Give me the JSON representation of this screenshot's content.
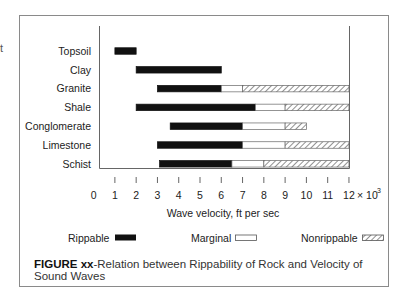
{
  "stray_text": "t",
  "caption": {
    "label": "FIGURE xx",
    "text": "-Relation between Rippability of Rock and Velocity of Sound Waves"
  },
  "legend": {
    "rippable": "Rippable",
    "marginal": "Marginal",
    "nonrippable": "Nonrippable"
  },
  "colors": {
    "rippable": "#111111",
    "marginal": "#ffffff",
    "nonrippable_hatch": "#555555",
    "frame": "#8a8a8a"
  },
  "chart_data": {
    "type": "bar",
    "orientation": "horizontal-range-stacked",
    "title": "Relation between Rippability of Rock and Velocity of Sound Waves",
    "xlabel": "Wave velocity, ft per sec",
    "x_multiplier": "x 10^3",
    "xlim": [
      0,
      12
    ],
    "x_ticks": [
      0,
      1,
      2,
      3,
      4,
      5,
      6,
      7,
      8,
      9,
      10,
      11,
      12
    ],
    "tick_labels": [
      "0",
      "1",
      "2",
      "3",
      "4",
      "5",
      "6",
      "7",
      "8",
      "9",
      "10",
      "11",
      "12"
    ],
    "multiplier_label": "x 10",
    "multiplier_exp": "3",
    "categories": [
      "Topsoil",
      "Clay",
      "Granite",
      "Shale",
      "Conglomerate",
      "Limestone",
      "Schist"
    ],
    "legend": [
      "Rippable",
      "Marginal",
      "Nonrippable"
    ],
    "legend_position": "bottom",
    "grid": false,
    "series": [
      {
        "name": "Rippable",
        "ranges": [
          [
            1,
            2
          ],
          [
            2,
            6
          ],
          [
            3,
            6
          ],
          [
            2,
            7.6
          ],
          [
            3.6,
            7
          ],
          [
            3,
            7
          ],
          [
            3.1,
            6.5
          ]
        ]
      },
      {
        "name": "Marginal",
        "ranges": [
          null,
          null,
          [
            6,
            7
          ],
          [
            7.6,
            9
          ],
          [
            7,
            9
          ],
          [
            7,
            9
          ],
          [
            6.5,
            8
          ]
        ]
      },
      {
        "name": "Nonrippable",
        "ranges": [
          null,
          null,
          [
            7,
            12
          ],
          [
            9,
            12
          ],
          [
            9,
            10
          ],
          [
            9,
            12
          ],
          [
            8,
            12
          ]
        ]
      }
    ]
  }
}
